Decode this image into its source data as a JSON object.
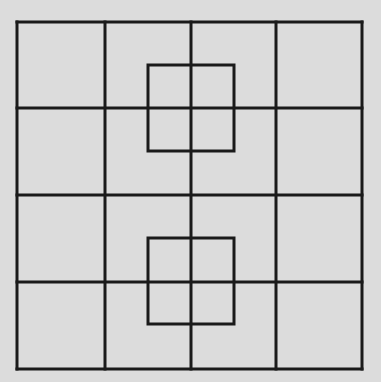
{
  "diagram": {
    "background": "#dcdcdc",
    "stroke": "#1a1a1a",
    "stroke_width": 3,
    "grid": {
      "rows": 4,
      "cols": 4,
      "x_lines": [
        17,
        105,
        191,
        276,
        362
      ],
      "y_lines": [
        22,
        108,
        195,
        282,
        369
      ]
    },
    "overlay_squares": [
      {
        "x": 148,
        "y": 65,
        "size": 86
      },
      {
        "x": 148,
        "y": 238,
        "size": 86
      }
    ]
  }
}
